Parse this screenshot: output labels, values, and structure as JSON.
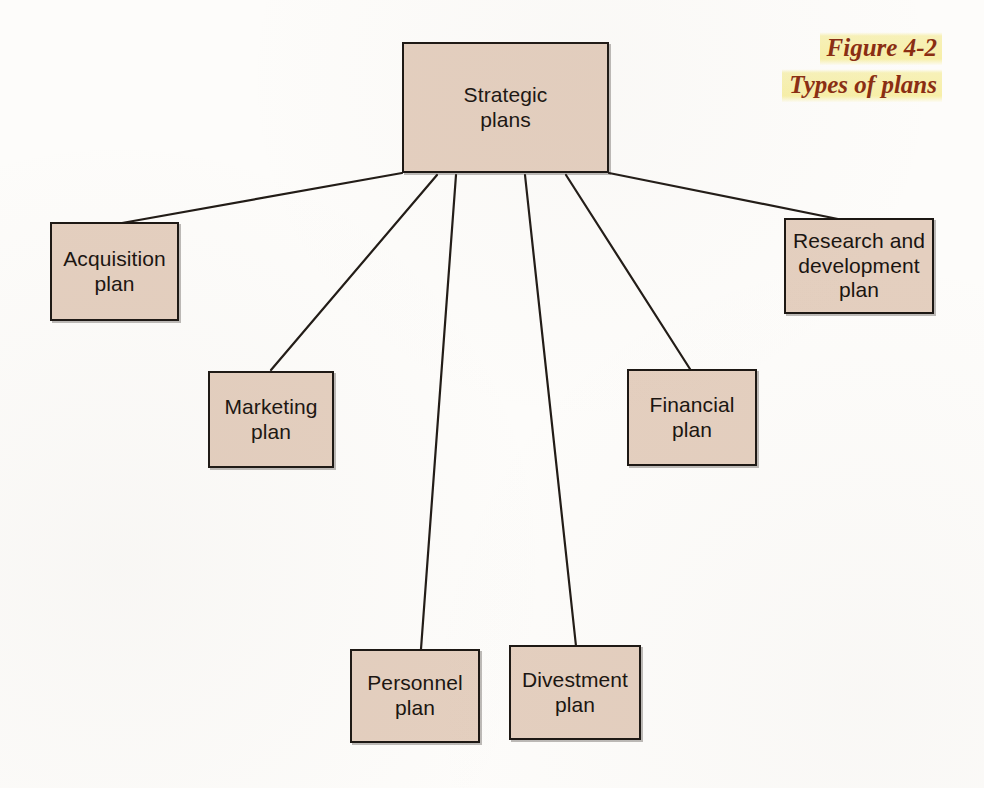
{
  "figure": {
    "caption_line1": "Figure 4-2",
    "caption_line2": "Types of plans",
    "caption_color": "#8a2d12",
    "highlight_color": "#f7efa8",
    "background_color": "#fdfcfa"
  },
  "diagram": {
    "type": "tree",
    "node_fill": "#e4cfbf",
    "node_border": "#1c1713",
    "connector_color": "#211b16",
    "root": {
      "id": "strategic-plans",
      "label": "Strategic\nplans",
      "x": 402,
      "y": 42,
      "w": 207,
      "h": 131
    },
    "children": [
      {
        "id": "acquisition-plan",
        "label": "Acquisition\nplan",
        "x": 50,
        "y": 222,
        "w": 129,
        "h": 99
      },
      {
        "id": "marketing-plan",
        "label": "Marketing\nplan",
        "x": 208,
        "y": 371,
        "w": 126,
        "h": 97
      },
      {
        "id": "personnel-plan",
        "label": "Personnel\nplan",
        "x": 350,
        "y": 649,
        "w": 130,
        "h": 94
      },
      {
        "id": "divestment-plan",
        "label": "Divestment\nplan",
        "x": 509,
        "y": 645,
        "w": 132,
        "h": 95
      },
      {
        "id": "financial-plan",
        "label": "Financial\nplan",
        "x": 627,
        "y": 369,
        "w": 130,
        "h": 97
      },
      {
        "id": "research-development-plan",
        "label": "Research and\ndevelopment\nplan",
        "x": 784,
        "y": 218,
        "w": 150,
        "h": 96
      }
    ],
    "connectors": [
      {
        "id": "link-acquisition",
        "x1": 402,
        "y1": 173,
        "x2": 122,
        "y2": 223
      },
      {
        "id": "link-marketing",
        "x1": 437,
        "y1": 175,
        "x2": 271,
        "y2": 370
      },
      {
        "id": "link-personnel",
        "x1": 456,
        "y1": 175,
        "x2": 421,
        "y2": 649
      },
      {
        "id": "link-divestment",
        "x1": 525,
        "y1": 175,
        "x2": 576,
        "y2": 646
      },
      {
        "id": "link-financial",
        "x1": 566,
        "y1": 175,
        "x2": 690,
        "y2": 369
      },
      {
        "id": "link-research-development",
        "x1": 609,
        "y1": 173,
        "x2": 838,
        "y2": 219
      }
    ]
  }
}
